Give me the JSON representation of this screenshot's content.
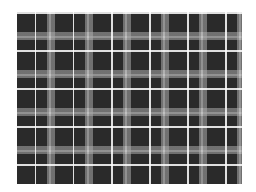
{
  "image": {
    "subject": "black, white and gray plaid fabric pattern",
    "colors": {
      "background": "#ffffff",
      "dark_square": "#2a2a2a",
      "gray_band": "#aaaaaa",
      "light_band": "#e6e6e6",
      "white_line": "#ffffff"
    },
    "pattern": {
      "type": "plaid",
      "repeat_px": 38,
      "region": {
        "x": 17,
        "y": 12,
        "width": 225,
        "height": 172
      }
    }
  }
}
